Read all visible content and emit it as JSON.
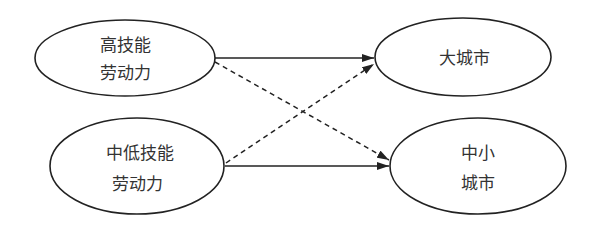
{
  "diagram": {
    "nodes": [
      {
        "id": "high_skill",
        "lines": [
          "高技能",
          "劳动力"
        ],
        "cx": 125,
        "cy": 58,
        "rx": 90,
        "ry": 38
      },
      {
        "id": "mid_low_skill",
        "lines": [
          "中低技能",
          "劳动力"
        ],
        "cx": 137,
        "cy": 166,
        "rx": 87,
        "ry": 48
      },
      {
        "id": "big_city",
        "lines": [
          "大城市"
        ],
        "cx": 463,
        "cy": 57,
        "rx": 88,
        "ry": 39
      },
      {
        "id": "small_mid_city",
        "lines": [
          "中小",
          "城市"
        ],
        "cx": 478,
        "cy": 166,
        "rx": 88,
        "ry": 48
      }
    ],
    "edges": [
      {
        "from": "high_skill",
        "to": "big_city",
        "style": "solid"
      },
      {
        "from": "high_skill",
        "to": "small_mid_city",
        "style": "dashed"
      },
      {
        "from": "mid_low_skill",
        "to": "big_city",
        "style": "dashed"
      },
      {
        "from": "mid_low_skill",
        "to": "small_mid_city",
        "style": "solid"
      }
    ],
    "colors": {
      "stroke": "#222222",
      "text": "#333333",
      "background": "#ffffff"
    }
  }
}
